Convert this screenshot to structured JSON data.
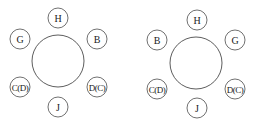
{
  "diagrams": [
    {
      "name": "arrangement-1",
      "table": {
        "cx": 58,
        "cy": 61,
        "r": 26
      },
      "seats": [
        {
          "label": "H",
          "x": 58,
          "y": 18
        },
        {
          "label": "G",
          "x": 20,
          "y": 39
        },
        {
          "label": "B",
          "x": 97,
          "y": 39
        },
        {
          "label": "C(D)",
          "x": 20,
          "y": 87
        },
        {
          "label": "D(C)",
          "x": 97,
          "y": 87
        },
        {
          "label": "J",
          "x": 58,
          "y": 107
        }
      ]
    },
    {
      "name": "arrangement-2",
      "table": {
        "cx": 196,
        "cy": 63,
        "r": 26
      },
      "seats": [
        {
          "label": "H",
          "x": 197,
          "y": 20
        },
        {
          "label": "B",
          "x": 157,
          "y": 40
        },
        {
          "label": "G",
          "x": 235,
          "y": 40
        },
        {
          "label": "C(D)",
          "x": 157,
          "y": 89
        },
        {
          "label": "D(C)",
          "x": 235,
          "y": 89
        },
        {
          "label": "J",
          "x": 197,
          "y": 108
        }
      ]
    }
  ],
  "style": {
    "stroke": "#333333",
    "seat_radius": 10
  }
}
